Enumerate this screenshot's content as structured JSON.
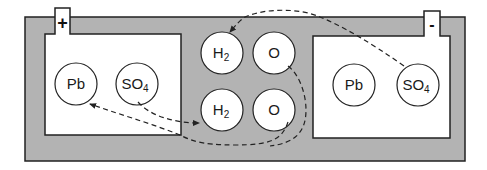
{
  "diagram": {
    "colors": {
      "electrolyte": "#b3b3b3",
      "plate": "#ffffff",
      "stroke": "#222222",
      "arrow": "#222222"
    },
    "terminals": {
      "positive": "+",
      "negative": "-"
    },
    "left_plate": {
      "molecules": [
        {
          "symbol": "Pb",
          "sub": ""
        },
        {
          "symbol": "SO",
          "sub": "4"
        }
      ]
    },
    "electrolyte": {
      "molecules": [
        {
          "symbol": "H",
          "sub": "2"
        },
        {
          "symbol": "O",
          "sub": ""
        },
        {
          "symbol": "H",
          "sub": "2"
        },
        {
          "symbol": "O",
          "sub": ""
        }
      ]
    },
    "right_plate": {
      "molecules": [
        {
          "symbol": "Pb",
          "sub": ""
        },
        {
          "symbol": "SO",
          "sub": "4"
        }
      ]
    },
    "arrows": [
      {
        "from": "right-SO4",
        "to": "top-H2",
        "style": "dashed"
      },
      {
        "from": "left-SO4",
        "to": "bottom-H2",
        "style": "dashed"
      },
      {
        "from": "top-O",
        "to": "left-Pb",
        "style": "dashed"
      },
      {
        "from": "bottom-O",
        "to": "left-Pb",
        "style": "dashed"
      }
    ]
  }
}
